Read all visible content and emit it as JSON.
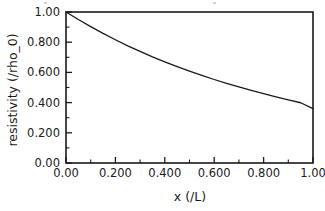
{
  "chart_data": {
    "type": "line",
    "title": "",
    "xlabel": "x (/L)",
    "ylabel": "resistivity  (/rho_0)",
    "xlim": [
      0.0,
      1.0
    ],
    "ylim": [
      0.0,
      1.0
    ],
    "grid": false,
    "legend": null,
    "xticks": [
      0.0,
      0.2,
      0.4,
      0.6,
      0.8,
      1.0
    ],
    "xticklabels": [
      "0.00",
      "0.200",
      "0.400",
      "0.600",
      "0.800",
      "1.00"
    ],
    "yticks": [
      0.0,
      0.2,
      0.4,
      0.6,
      0.8,
      1.0
    ],
    "yticklabels": [
      "0.00",
      "0.200",
      "0.400",
      "0.600",
      "0.800",
      "1.00"
    ],
    "minor_ticks_per_interval": 1,
    "tick_direction": "in",
    "line_color": "#1a1a1a",
    "line_width": 1.3,
    "series": [
      {
        "name": "resistivity",
        "x": [
          0.0,
          0.05,
          0.1,
          0.15,
          0.2,
          0.25,
          0.3,
          0.35,
          0.4,
          0.45,
          0.5,
          0.55,
          0.6,
          0.65,
          0.7,
          0.75,
          0.8,
          0.85,
          0.9,
          0.95,
          1.0
        ],
        "y": [
          1.0,
          0.95,
          0.903,
          0.858,
          0.816,
          0.776,
          0.739,
          0.703,
          0.67,
          0.638,
          0.608,
          0.58,
          0.553,
          0.528,
          0.504,
          0.481,
          0.459,
          0.438,
          0.418,
          0.399,
          0.36
        ]
      }
    ]
  },
  "axes": {
    "frame_color": "#1a1a1a",
    "background": "#ffffff"
  }
}
